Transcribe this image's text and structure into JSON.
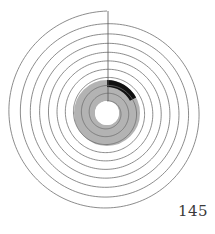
{
  "page": {
    "page_number": "145",
    "background": "#ffffff"
  },
  "diagram": {
    "type": "archimedean-spiral",
    "center": [
      107,
      113
    ],
    "outer_radius": 102,
    "inner_radius": 12,
    "turns": 10,
    "direction": "counter-clockwise-inward",
    "start_angle_deg": 0,
    "line_color": "#6e6e6e",
    "line_width": 0.8,
    "radial_line": {
      "from_y": 11,
      "to_y": 113,
      "x": 108,
      "color": "#555555"
    },
    "gray_band": {
      "inner_r": 12,
      "outer_r": 33,
      "color": "#b3b3b3"
    },
    "black_arc": {
      "inner_r": 26,
      "outer_r": 33,
      "start_deg": 0,
      "end_deg": 62,
      "color": "#111111"
    }
  }
}
